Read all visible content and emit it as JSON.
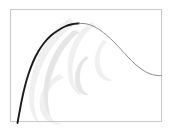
{
  "figure": {
    "kind": "line-plot",
    "background_color": "#ffffff",
    "frame": {
      "border_color": "#c9c9c9",
      "x": 10,
      "y": 9,
      "width": 152,
      "height": 113,
      "fill": "none"
    },
    "watermark": {
      "present": true,
      "description": "faint light-grey swirl / wave glyph behind the plot",
      "color": "#f0f0f0",
      "accent_color": "#e6e6e6"
    }
  },
  "chart_data": {
    "type": "line",
    "title": "",
    "subtitle": "",
    "xlabel": "",
    "ylabel": "",
    "grid": false,
    "legend": null,
    "axis_ticks": {
      "x": [],
      "y": []
    },
    "xlim": [
      10,
      162
    ],
    "ylim": [
      122,
      9
    ],
    "annotations": [],
    "series": [
      {
        "name": "curve-rising-segment",
        "color": "#1a1a1a",
        "line_width": 1.9,
        "style": "solid",
        "points": [
          [
            17.5,
            123.0
          ],
          [
            19.5,
            112.0
          ],
          [
            22.0,
            99.0
          ],
          [
            25.0,
            86.0
          ],
          [
            28.5,
            74.0
          ],
          [
            33.0,
            62.0
          ],
          [
            38.0,
            52.0
          ],
          [
            44.0,
            43.0
          ],
          [
            51.0,
            35.5
          ],
          [
            58.0,
            30.5
          ],
          [
            65.0,
            26.5
          ],
          [
            72.0,
            24.3
          ],
          [
            79.0,
            23.4
          ]
        ]
      },
      {
        "name": "curve-falling-segment",
        "color": "#8c8c8c",
        "line_width": 1.0,
        "style": "solid",
        "points": [
          [
            79.0,
            23.4
          ],
          [
            86.0,
            23.8
          ],
          [
            93.0,
            26.0
          ],
          [
            100.0,
            30.0
          ],
          [
            107.0,
            35.5
          ],
          [
            114.0,
            42.0
          ],
          [
            121.0,
            49.5
          ],
          [
            128.0,
            57.0
          ],
          [
            135.0,
            64.0
          ],
          [
            142.0,
            69.5
          ],
          [
            149.0,
            73.5
          ],
          [
            156.0,
            75.3
          ],
          [
            161.5,
            75.5
          ]
        ]
      }
    ],
    "peak": {
      "x": 79,
      "y": 23.4,
      "label": ""
    }
  }
}
